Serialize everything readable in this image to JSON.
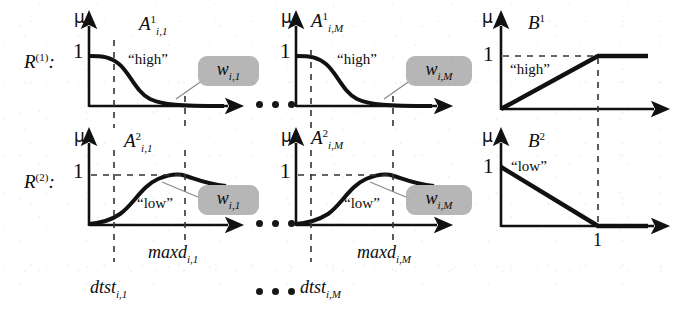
{
  "figure": {
    "type": "diagram",
    "background_color": "#ffffff",
    "ink_color": "#111111",
    "weight_box_color": "#b6b6b6"
  },
  "rows": [
    {
      "id": "row-1",
      "rule_label": "R",
      "rule_superscript": "(1)",
      "rule_colon": ":",
      "panels": [
        {
          "id": "r1-p1",
          "axis_y_label": "μ",
          "axis_y_tick": "1",
          "set_label": "A",
          "set_superscript": "1",
          "set_subscript": "i,1",
          "term_label": "“high”",
          "curve": "decreasing-sigmoid",
          "weight_label": "w",
          "weight_subscript": "i,1"
        },
        {
          "id": "r1-p2",
          "axis_y_label": "μ",
          "axis_y_tick": "1",
          "set_label": "A",
          "set_superscript": "1",
          "set_subscript": "i,M",
          "term_label": "“high”",
          "curve": "decreasing-sigmoid",
          "weight_label": "w",
          "weight_subscript": "i,M"
        },
        {
          "id": "r1-p3",
          "axis_y_label": "μ",
          "axis_y_tick": "1",
          "set_label": "B",
          "set_superscript": "1",
          "set_subscript": "",
          "term_label": "“high”",
          "curve": "increasing-ramp",
          "x_tick_label": ""
        }
      ]
    },
    {
      "id": "row-2",
      "rule_label": "R",
      "rule_superscript": "(2)",
      "rule_colon": ":",
      "panels": [
        {
          "id": "r2-p1",
          "axis_y_label": "μ",
          "axis_y_tick": "1",
          "set_label": "A",
          "set_superscript": "2",
          "set_subscript": "i,1",
          "term_label": "“low”",
          "curve": "increasing-bell",
          "weight_label": "w",
          "weight_subscript": "i,1"
        },
        {
          "id": "r2-p2",
          "axis_y_label": "μ",
          "axis_y_tick": "1",
          "set_label": "A",
          "set_superscript": "2",
          "set_subscript": "i,M",
          "term_label": "“low”",
          "curve": "increasing-bell",
          "weight_label": "w",
          "weight_subscript": "i,M"
        },
        {
          "id": "r2-p3",
          "axis_y_label": "μ",
          "axis_y_tick": "1",
          "set_label": "B",
          "set_superscript": "2",
          "set_subscript": "",
          "term_label": "“low”",
          "curve": "decreasing-ramp",
          "x_tick_label": "1"
        }
      ]
    }
  ],
  "bottom_labels": {
    "maxd_1": {
      "base": "maxd",
      "sub": "i,1"
    },
    "maxd_M": {
      "base": "maxd",
      "sub": "i,M"
    },
    "dtst_1": {
      "base": "dtst",
      "sub": "i,1"
    },
    "dtst_M": {
      "base": "dtst",
      "sub": "i,M"
    }
  },
  "ellipses": [
    {
      "id": "ellipsis-row1",
      "glyph": "•••"
    },
    {
      "id": "ellipsis-row2",
      "glyph": "•••"
    },
    {
      "id": "ellipsis-bottom",
      "glyph": "•••"
    }
  ]
}
